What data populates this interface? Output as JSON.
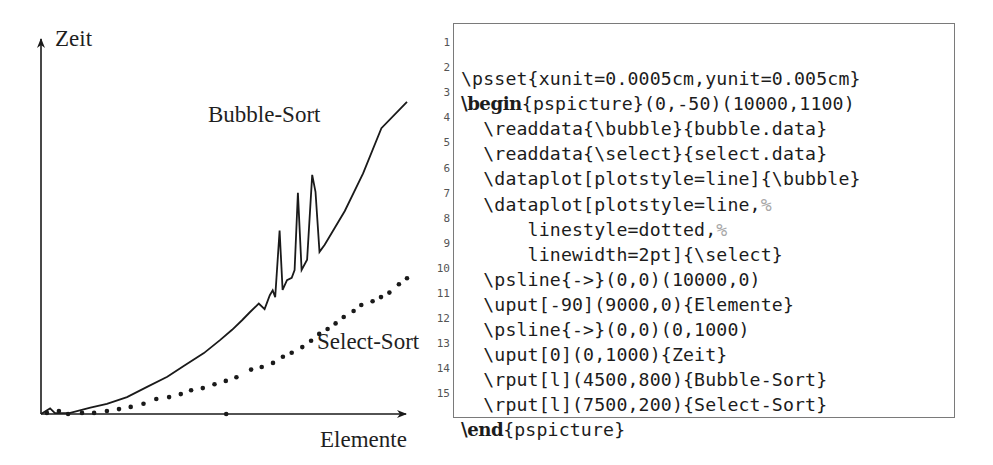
{
  "chart_data": {
    "type": "line",
    "title": "",
    "xlabel": "Elemente",
    "ylabel": "Zeit",
    "xlim": [
      0,
      10000
    ],
    "ylim": [
      -50,
      1100
    ],
    "grid": false,
    "axes": {
      "x_axis": {
        "from": [
          0,
          0
        ],
        "to": [
          10000,
          0
        ],
        "arrow": true
      },
      "y_axis": {
        "from": [
          0,
          0
        ],
        "to": [
          0,
          1000
        ],
        "arrow": true
      }
    },
    "annotations": [
      {
        "text": "Bubble-Sort",
        "x": 4500,
        "y": 800
      },
      {
        "text": "Select-Sort",
        "x": 7500,
        "y": 200
      },
      {
        "text": "Zeit",
        "x": 0,
        "y": 1000
      },
      {
        "text": "Elemente",
        "x": 9000,
        "y": 0
      }
    ],
    "series": [
      {
        "name": "Bubble-Sort",
        "style": "solid",
        "points": [
          [
            0,
            0
          ],
          [
            250,
            15
          ],
          [
            380,
            2
          ],
          [
            800,
            3
          ],
          [
            1350,
            17
          ],
          [
            1800,
            27
          ],
          [
            2350,
            45
          ],
          [
            2900,
            72
          ],
          [
            3450,
            99
          ],
          [
            3900,
            128
          ],
          [
            4450,
            162
          ],
          [
            4900,
            197
          ],
          [
            5220,
            224
          ],
          [
            5500,
            250
          ],
          [
            5700,
            270
          ],
          [
            5950,
            294
          ],
          [
            6110,
            279
          ],
          [
            6250,
            316
          ],
          [
            6330,
            329
          ],
          [
            6400,
            311
          ],
          [
            6520,
            488
          ],
          [
            6600,
            330
          ],
          [
            6720,
            356
          ],
          [
            6850,
            362
          ],
          [
            6930,
            383
          ],
          [
            7020,
            588
          ],
          [
            7120,
            383
          ],
          [
            7270,
            410
          ],
          [
            7410,
            636
          ],
          [
            7500,
            591
          ],
          [
            7610,
            431
          ],
          [
            7750,
            450
          ],
          [
            8300,
            540
          ],
          [
            8800,
            640
          ],
          [
            9300,
            760
          ],
          [
            10000,
            830
          ]
        ]
      },
      {
        "name": "Select-Sort",
        "style": "dotted",
        "linewidth": "2pt",
        "points": [
          [
            160,
            3
          ],
          [
            490,
            8
          ],
          [
            740,
            0
          ],
          [
            1120,
            3
          ],
          [
            1450,
            3
          ],
          [
            1800,
            8
          ],
          [
            2130,
            13
          ],
          [
            2450,
            19
          ],
          [
            2800,
            27
          ],
          [
            3150,
            40
          ],
          [
            3500,
            45
          ],
          [
            3820,
            53
          ],
          [
            4100,
            63
          ],
          [
            4420,
            69
          ],
          [
            4740,
            79
          ],
          [
            5050,
            88
          ],
          [
            5340,
            98
          ],
          [
            5740,
            118
          ],
          [
            5060,
            0
          ],
          [
            6030,
            125
          ],
          [
            6340,
            136
          ],
          [
            6610,
            152
          ],
          [
            6850,
            163
          ],
          [
            7140,
            178
          ],
          [
            7380,
            195
          ],
          [
            7600,
            213
          ],
          [
            7830,
            226
          ],
          [
            8050,
            241
          ],
          [
            8270,
            258
          ],
          [
            8540,
            274
          ],
          [
            8750,
            290
          ],
          [
            9060,
            300
          ],
          [
            9290,
            311
          ],
          [
            9520,
            323
          ],
          [
            9780,
            345
          ],
          [
            10000,
            361
          ]
        ]
      }
    ]
  },
  "labels": {
    "y_axis": "Zeit",
    "x_axis": "Elemente",
    "bubble": "Bubble-Sort",
    "select": "Select-Sort"
  },
  "listing": {
    "lines": [
      {
        "no": "1",
        "indent": "",
        "kw": "",
        "text": "\\psset{xunit=0.0005cm,yunit=0.005cm}",
        "comment": ""
      },
      {
        "no": "2",
        "indent": "",
        "kw": "\\begin",
        "text": "{pspicture}(0,-50)(10000,1100)",
        "comment": ""
      },
      {
        "no": "3",
        "indent": "  ",
        "kw": "",
        "text": "\\readdata{\\bubble}{bubble.data}",
        "comment": ""
      },
      {
        "no": "4",
        "indent": "  ",
        "kw": "",
        "text": "\\readdata{\\select}{select.data}",
        "comment": ""
      },
      {
        "no": "5",
        "indent": "  ",
        "kw": "",
        "text": "\\dataplot[plotstyle=line]{\\bubble}",
        "comment": ""
      },
      {
        "no": "6",
        "indent": "  ",
        "kw": "",
        "text": "\\dataplot[plotstyle=line,",
        "comment": "%"
      },
      {
        "no": "7",
        "indent": "      ",
        "kw": "",
        "text": "linestyle=dotted,",
        "comment": "%"
      },
      {
        "no": "8",
        "indent": "      ",
        "kw": "",
        "text": "linewidth=2pt]{\\select}",
        "comment": ""
      },
      {
        "no": "9",
        "indent": "  ",
        "kw": "",
        "text": "\\psline{->}(0,0)(10000,0)",
        "comment": ""
      },
      {
        "no": "10",
        "indent": "  ",
        "kw": "",
        "text": "\\uput[-90](9000,0){Elemente}",
        "comment": ""
      },
      {
        "no": "11",
        "indent": "  ",
        "kw": "",
        "text": "\\psline{->}(0,0)(0,1000)",
        "comment": ""
      },
      {
        "no": "12",
        "indent": "  ",
        "kw": "",
        "text": "\\uput[0](0,1000){Zeit}",
        "comment": ""
      },
      {
        "no": "13",
        "indent": "  ",
        "kw": "",
        "text": "\\rput[l](4500,800){Bubble-Sort}",
        "comment": ""
      },
      {
        "no": "14",
        "indent": "  ",
        "kw": "",
        "text": "\\rput[l](7500,200){Select-Sort}",
        "comment": ""
      },
      {
        "no": "15",
        "indent": "",
        "kw": "\\end",
        "text": "{pspicture}",
        "comment": ""
      }
    ]
  },
  "colors": {
    "ink": "#1a1a1a",
    "frame": "#7a7a7a",
    "comment": "#a8a8a8",
    "line_number": "#555555"
  }
}
